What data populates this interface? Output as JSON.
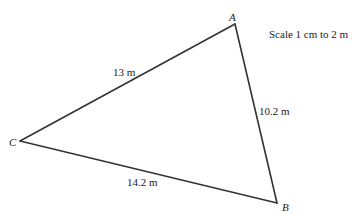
{
  "diagram": {
    "type": "triangle",
    "scale_text": "Scale 1 cm to 2 m",
    "vertices": [
      {
        "id": "A",
        "label": "A",
        "x": 235,
        "y": 24
      },
      {
        "id": "B",
        "label": "B",
        "x": 277,
        "y": 203
      },
      {
        "id": "C",
        "label": "C",
        "x": 20,
        "y": 141
      }
    ],
    "sides": [
      {
        "from": "C",
        "to": "A",
        "label": "13 m"
      },
      {
        "from": "A",
        "to": "B",
        "label": "10.2 m"
      },
      {
        "from": "C",
        "to": "B",
        "label": "14.2 m"
      }
    ],
    "line_color": "#333333",
    "text_color": "#222222"
  }
}
